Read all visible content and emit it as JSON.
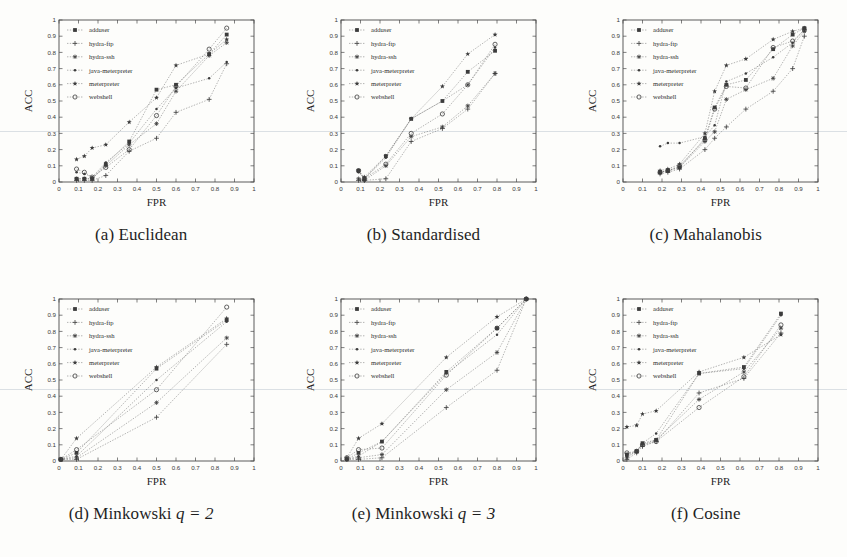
{
  "figure": {
    "background": "#fdfdfb",
    "ink": "#3c3c3c",
    "axis_color": "#4a4a4a"
  },
  "legend": {
    "entries": [
      {
        "label": "adduser",
        "marker": "square"
      },
      {
        "label": "hydra-ftp",
        "marker": "plus"
      },
      {
        "label": "hydra-ssh",
        "marker": "asterisk"
      },
      {
        "label": "java-meterpreter",
        "marker": "dot"
      },
      {
        "label": "meterpreter",
        "marker": "star"
      },
      {
        "label": "webshell",
        "marker": "circle"
      }
    ]
  },
  "axes": {
    "xlabel": "FPR",
    "ylabel": "ACC",
    "xlim": [
      0,
      1
    ],
    "ylim": [
      0,
      1
    ],
    "xticks": [
      "0",
      "0.1",
      "0.2",
      "0.3",
      "0.4",
      "0.5",
      "0.6",
      "0.7",
      "0.8",
      "0.9",
      "1"
    ],
    "yticks": [
      "0",
      "0.1",
      "0.2",
      "0.3",
      "0.4",
      "0.5",
      "0.6",
      "0.7",
      "0.8",
      "0.9",
      "1"
    ]
  },
  "captions": {
    "a": "(a) Euclidean",
    "b": "(b) Standardised",
    "c": "(c) Mahalanobis",
    "d_pre": "(d) Minkowski ",
    "d_math": "q = 2",
    "e_pre": "(e) Minkowski ",
    "e_math": "q = 3",
    "f": "(f) Cosine"
  },
  "chart_data": [
    {
      "id": "a",
      "type": "scatter",
      "title": "(a) Euclidean",
      "xlabel": "FPR",
      "ylabel": "ACC",
      "xlim": [
        0,
        1
      ],
      "ylim": [
        0,
        1
      ],
      "grid": false,
      "legend_position": "upper-left",
      "series": [
        {
          "name": "adduser",
          "x": [
            0.09,
            0.13,
            0.17,
            0.24,
            0.36,
            0.5,
            0.6,
            0.77,
            0.86
          ],
          "y": [
            0.02,
            0.02,
            0.02,
            0.11,
            0.25,
            0.57,
            0.6,
            0.79,
            0.91
          ]
        },
        {
          "name": "hydra-ftp",
          "x": [
            0.09,
            0.13,
            0.17,
            0.24,
            0.36,
            0.5,
            0.6,
            0.77,
            0.86
          ],
          "y": [
            0.01,
            0.01,
            0.01,
            0.04,
            0.19,
            0.27,
            0.43,
            0.51,
            0.73
          ]
        },
        {
          "name": "hydra-ssh",
          "x": [
            0.09,
            0.13,
            0.17,
            0.24,
            0.36,
            0.5,
            0.6,
            0.77,
            0.86
          ],
          "y": [
            0.02,
            0.02,
            0.02,
            0.1,
            0.23,
            0.36,
            0.56,
            0.78,
            0.86
          ]
        },
        {
          "name": "java-meterpreter",
          "x": [
            0.09,
            0.13,
            0.17,
            0.24,
            0.36,
            0.5,
            0.6,
            0.77,
            0.86
          ],
          "y": [
            0.06,
            0.05,
            0.03,
            0.12,
            0.24,
            0.45,
            0.58,
            0.64,
            0.74
          ]
        },
        {
          "name": "meterpreter",
          "x": [
            0.09,
            0.13,
            0.17,
            0.24,
            0.36,
            0.5,
            0.6,
            0.77,
            0.86
          ],
          "y": [
            0.14,
            0.16,
            0.21,
            0.23,
            0.37,
            0.52,
            0.72,
            0.79,
            0.88
          ]
        },
        {
          "name": "webshell",
          "x": [
            0.09,
            0.13,
            0.17,
            0.24,
            0.36,
            0.5,
            0.6,
            0.77,
            0.86
          ],
          "y": [
            0.08,
            0.06,
            0.03,
            0.09,
            0.2,
            0.41,
            0.59,
            0.82,
            0.95
          ]
        }
      ]
    },
    {
      "id": "b",
      "type": "scatter",
      "title": "(b) Standardised",
      "xlabel": "FPR",
      "ylabel": "ACC",
      "xlim": [
        0,
        1
      ],
      "ylim": [
        0,
        1
      ],
      "grid": false,
      "legend_position": "upper-left",
      "series": [
        {
          "name": "adduser",
          "x": [
            0.09,
            0.12,
            0.23,
            0.36,
            0.52,
            0.65,
            0.79
          ],
          "y": [
            0.07,
            0.02,
            0.16,
            0.39,
            0.5,
            0.68,
            0.81
          ]
        },
        {
          "name": "hydra-ftp",
          "x": [
            0.09,
            0.12,
            0.23,
            0.36,
            0.52,
            0.65,
            0.79
          ],
          "y": [
            0.01,
            0.01,
            0.02,
            0.25,
            0.33,
            0.45,
            0.67
          ]
        },
        {
          "name": "hydra-ssh",
          "x": [
            0.09,
            0.12,
            0.23,
            0.36,
            0.52,
            0.65,
            0.79
          ],
          "y": [
            0.02,
            0.01,
            0.1,
            0.28,
            0.34,
            0.47,
            0.67
          ]
        },
        {
          "name": "java-meterpreter",
          "x": [
            0.09,
            0.12,
            0.23,
            0.36,
            0.52,
            0.65,
            0.79
          ],
          "y": [
            0.06,
            0.02,
            0.15,
            0.39,
            0.5,
            0.6,
            0.83
          ]
        },
        {
          "name": "meterpreter",
          "x": [
            0.09,
            0.12,
            0.23,
            0.36,
            0.52,
            0.65,
            0.79
          ],
          "y": [
            0.07,
            0.03,
            0.16,
            0.39,
            0.59,
            0.79,
            0.91
          ]
        },
        {
          "name": "webshell",
          "x": [
            0.09,
            0.12,
            0.23,
            0.36,
            0.52,
            0.65,
            0.79
          ],
          "y": [
            0.07,
            0.02,
            0.11,
            0.3,
            0.42,
            0.6,
            0.85
          ]
        }
      ]
    },
    {
      "id": "c",
      "type": "scatter",
      "title": "(c) Mahalanobis",
      "xlabel": "FPR",
      "ylabel": "ACC",
      "xlim": [
        0,
        1
      ],
      "ylim": [
        0,
        1
      ],
      "grid": false,
      "legend_position": "upper-left",
      "series": [
        {
          "name": "adduser",
          "x": [
            0.19,
            0.23,
            0.29,
            0.42,
            0.47,
            0.53,
            0.63,
            0.77,
            0.87,
            0.93
          ],
          "y": [
            0.06,
            0.07,
            0.09,
            0.27,
            0.46,
            0.6,
            0.63,
            0.82,
            0.91,
            0.95
          ]
        },
        {
          "name": "hydra-ftp",
          "x": [
            0.19,
            0.23,
            0.29,
            0.42,
            0.47,
            0.53,
            0.63,
            0.77,
            0.87,
            0.93
          ],
          "y": [
            0.05,
            0.06,
            0.08,
            0.2,
            0.27,
            0.34,
            0.45,
            0.56,
            0.7,
            0.9
          ]
        },
        {
          "name": "hydra-ssh",
          "x": [
            0.19,
            0.23,
            0.29,
            0.42,
            0.47,
            0.53,
            0.63,
            0.77,
            0.87,
            0.93
          ],
          "y": [
            0.06,
            0.07,
            0.09,
            0.25,
            0.31,
            0.51,
            0.57,
            0.64,
            0.84,
            0.93
          ]
        },
        {
          "name": "java-meterpreter",
          "x": [
            0.19,
            0.23,
            0.29,
            0.42,
            0.47,
            0.53,
            0.63,
            0.77,
            0.87,
            0.93
          ],
          "y": [
            0.22,
            0.24,
            0.24,
            0.28,
            0.35,
            0.62,
            0.67,
            0.77,
            0.86,
            0.94
          ]
        },
        {
          "name": "meterpreter",
          "x": [
            0.19,
            0.23,
            0.29,
            0.42,
            0.47,
            0.53,
            0.63,
            0.77,
            0.87,
            0.93
          ],
          "y": [
            0.07,
            0.08,
            0.11,
            0.3,
            0.56,
            0.72,
            0.76,
            0.88,
            0.93,
            0.95
          ]
        },
        {
          "name": "webshell",
          "x": [
            0.19,
            0.23,
            0.29,
            0.42,
            0.47,
            0.53,
            0.63,
            0.77,
            0.87,
            0.93
          ],
          "y": [
            0.06,
            0.07,
            0.1,
            0.26,
            0.45,
            0.59,
            0.58,
            0.83,
            0.87,
            0.94
          ]
        }
      ]
    },
    {
      "id": "d",
      "type": "scatter",
      "title": "(d) Minkowski q = 2",
      "xlabel": "FPR",
      "ylabel": "ACC",
      "xlim": [
        0,
        1
      ],
      "ylim": [
        0,
        1
      ],
      "grid": false,
      "legend_position": "upper-left",
      "series": [
        {
          "name": "adduser",
          "x": [
            0.01,
            0.09,
            0.5,
            0.86
          ],
          "y": [
            0.01,
            0.05,
            0.57,
            0.87
          ]
        },
        {
          "name": "hydra-ftp",
          "x": [
            0.01,
            0.09,
            0.5,
            0.86
          ],
          "y": [
            0.01,
            0.01,
            0.27,
            0.72
          ]
        },
        {
          "name": "hydra-ssh",
          "x": [
            0.01,
            0.09,
            0.5,
            0.86
          ],
          "y": [
            0.01,
            0.02,
            0.36,
            0.76
          ]
        },
        {
          "name": "java-meterpreter",
          "x": [
            0.01,
            0.09,
            0.5,
            0.86
          ],
          "y": [
            0.01,
            0.03,
            0.5,
            0.86
          ]
        },
        {
          "name": "meterpreter",
          "x": [
            0.01,
            0.09,
            0.5,
            0.86
          ],
          "y": [
            0.01,
            0.14,
            0.58,
            0.88
          ]
        },
        {
          "name": "webshell",
          "x": [
            0.01,
            0.09,
            0.5,
            0.86
          ],
          "y": [
            0.01,
            0.07,
            0.44,
            0.95
          ]
        }
      ]
    },
    {
      "id": "e",
      "type": "scatter",
      "title": "(e) Minkowski q = 3",
      "xlabel": "FPR",
      "ylabel": "ACC",
      "xlim": [
        0,
        1
      ],
      "ylim": [
        0,
        1
      ],
      "grid": false,
      "legend_position": "upper-left",
      "series": [
        {
          "name": "adduser",
          "x": [
            0.03,
            0.09,
            0.21,
            0.54,
            0.8,
            0.95
          ],
          "y": [
            0.01,
            0.05,
            0.12,
            0.55,
            0.82,
            1.0
          ]
        },
        {
          "name": "hydra-ftp",
          "x": [
            0.03,
            0.09,
            0.21,
            0.54,
            0.8,
            0.95
          ],
          "y": [
            0.01,
            0.01,
            0.02,
            0.33,
            0.56,
            1.0
          ]
        },
        {
          "name": "hydra-ssh",
          "x": [
            0.03,
            0.09,
            0.21,
            0.54,
            0.8,
            0.95
          ],
          "y": [
            0.01,
            0.02,
            0.04,
            0.44,
            0.67,
            1.0
          ]
        },
        {
          "name": "java-meterpreter",
          "x": [
            0.03,
            0.09,
            0.21,
            0.54,
            0.8,
            0.95
          ],
          "y": [
            0.01,
            0.03,
            0.12,
            0.54,
            0.78,
            1.0
          ]
        },
        {
          "name": "meterpreter",
          "x": [
            0.03,
            0.09,
            0.21,
            0.54,
            0.8,
            0.95
          ],
          "y": [
            0.02,
            0.14,
            0.23,
            0.64,
            0.89,
            1.0
          ]
        },
        {
          "name": "webshell",
          "x": [
            0.03,
            0.09,
            0.21,
            0.54,
            0.8,
            0.95
          ],
          "y": [
            0.02,
            0.07,
            0.08,
            0.53,
            0.82,
            1.0
          ]
        }
      ]
    },
    {
      "id": "f",
      "type": "scatter",
      "title": "(f) Cosine",
      "xlabel": "FPR",
      "ylabel": "ACC",
      "xlim": [
        0,
        1
      ],
      "ylim": [
        0,
        1
      ],
      "grid": false,
      "legend_position": "upper-left",
      "series": [
        {
          "name": "adduser",
          "x": [
            0.02,
            0.07,
            0.1,
            0.17,
            0.39,
            0.62,
            0.81
          ],
          "y": [
            0.04,
            0.06,
            0.11,
            0.13,
            0.54,
            0.58,
            0.91
          ]
        },
        {
          "name": "hydra-ftp",
          "x": [
            0.02,
            0.07,
            0.1,
            0.17,
            0.39,
            0.62,
            0.81
          ],
          "y": [
            0.01,
            0.05,
            0.09,
            0.12,
            0.42,
            0.51,
            0.79
          ]
        },
        {
          "name": "hydra-ssh",
          "x": [
            0.02,
            0.07,
            0.1,
            0.17,
            0.39,
            0.62,
            0.81
          ],
          "y": [
            0.02,
            0.06,
            0.1,
            0.13,
            0.38,
            0.55,
            0.82
          ]
        },
        {
          "name": "java-meterpreter",
          "x": [
            0.02,
            0.07,
            0.1,
            0.17,
            0.39,
            0.62,
            0.81
          ],
          "y": [
            0.03,
            0.06,
            0.11,
            0.17,
            0.54,
            0.57,
            0.9
          ]
        },
        {
          "name": "meterpreter",
          "x": [
            0.02,
            0.07,
            0.1,
            0.17,
            0.39,
            0.62,
            0.81
          ],
          "y": [
            0.21,
            0.22,
            0.29,
            0.31,
            0.55,
            0.64,
            0.78
          ]
        },
        {
          "name": "webshell",
          "x": [
            0.02,
            0.07,
            0.1,
            0.17,
            0.39,
            0.62,
            0.81
          ],
          "y": [
            0.05,
            0.06,
            0.1,
            0.12,
            0.33,
            0.52,
            0.84
          ]
        }
      ]
    }
  ]
}
